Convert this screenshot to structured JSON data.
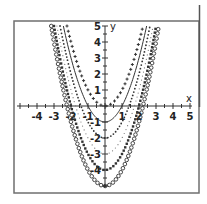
{
  "chart_data": {
    "type": "line",
    "title": "",
    "xlabel": "x",
    "ylabel": "y",
    "xlim": [
      -5,
      5
    ],
    "ylim": [
      -5,
      5
    ],
    "grid": false,
    "legend": null,
    "x_ticks": [
      -4,
      -3,
      -2,
      -1,
      1,
      2,
      3,
      4,
      5
    ],
    "x_tick_labels": [
      "-4",
      "-3",
      "-2",
      "-1",
      "1",
      "2",
      "3",
      "4",
      "5"
    ],
    "y_ticks": [
      -4,
      -3,
      -2,
      -1,
      1,
      2,
      3,
      4,
      5
    ],
    "y_tick_labels": [
      "-4",
      "-3",
      "-2",
      "-1",
      "1",
      "2",
      "3",
      "4",
      "5"
    ],
    "series": [
      {
        "name": "y = x^2",
        "shift": 0,
        "marker": "cross",
        "vertex": [
          0,
          0
        ]
      },
      {
        "name": "y = x^2 - 1",
        "shift": -1,
        "marker": "solid-line",
        "vertex": [
          0,
          -1
        ]
      },
      {
        "name": "y = x^2 - 2",
        "shift": -2,
        "marker": "small-dots",
        "vertex": [
          0,
          -2
        ]
      },
      {
        "name": "y = x^2 - 3",
        "shift": -3,
        "marker": "fine-dots",
        "vertex": [
          0,
          -3
        ]
      },
      {
        "name": "y = x^2 - 4",
        "shift": -4,
        "marker": "bold-dots",
        "vertex": [
          0,
          -4
        ]
      },
      {
        "name": "y = x^2 - 5",
        "shift": -5,
        "marker": "open-circles",
        "vertex": [
          0,
          -5
        ]
      }
    ]
  },
  "colors": {
    "curve": "#333333",
    "frame": "#6f6f6f",
    "background": "#ffffff"
  }
}
